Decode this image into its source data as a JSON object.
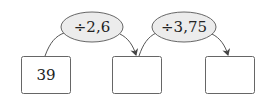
{
  "diagram": {
    "type": "operation-chain",
    "operations": [
      {
        "label": "÷2,6"
      },
      {
        "label": "÷3,75"
      }
    ],
    "boxes": [
      {
        "value": "39"
      },
      {
        "value": ""
      },
      {
        "value": ""
      }
    ]
  },
  "colors": {
    "ellipse_fill": "#ececec",
    "stroke": "#555555",
    "box_stroke": "#666666",
    "text": "#222222"
  }
}
